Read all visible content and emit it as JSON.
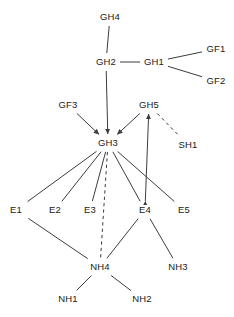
{
  "diagram": {
    "title": "",
    "width": 234,
    "height": 317,
    "background_color": "#ffffff",
    "edge_color": "#3c3c3c",
    "label_color": "#1a1a1a",
    "nodes": [
      {
        "id": "GH4",
        "label": "GH4",
        "x": 110,
        "y": 17
      },
      {
        "id": "GH2",
        "label": "GH2",
        "x": 106,
        "y": 62
      },
      {
        "id": "GH1",
        "label": "GH1",
        "x": 154,
        "y": 62
      },
      {
        "id": "GF1",
        "label": "GF1",
        "x": 216,
        "y": 49
      },
      {
        "id": "GF2",
        "label": "GF2",
        "x": 216,
        "y": 81
      },
      {
        "id": "GF3",
        "label": "GF3",
        "x": 68,
        "y": 105
      },
      {
        "id": "GH5",
        "label": "GH5",
        "x": 149,
        "y": 105
      },
      {
        "id": "SH1",
        "label": "SH1",
        "x": 188,
        "y": 145
      },
      {
        "id": "GH3",
        "label": "GH3",
        "x": 108,
        "y": 143
      },
      {
        "id": "E1",
        "label": "E1",
        "x": 16,
        "y": 210
      },
      {
        "id": "E2",
        "label": "E2",
        "x": 55,
        "y": 210
      },
      {
        "id": "E3",
        "label": "E3",
        "x": 90,
        "y": 210
      },
      {
        "id": "E4",
        "label": "E4",
        "x": 145,
        "y": 210
      },
      {
        "id": "E5",
        "label": "E5",
        "x": 184,
        "y": 210
      },
      {
        "id": "NH4",
        "label": "NH4",
        "x": 100,
        "y": 267
      },
      {
        "id": "NH3",
        "label": "NH3",
        "x": 178,
        "y": 267
      },
      {
        "id": "NH1",
        "label": "NH1",
        "x": 68,
        "y": 299
      },
      {
        "id": "NH2",
        "label": "NH2",
        "x": 142,
        "y": 299
      }
    ],
    "edges": [
      {
        "from": "GH4",
        "to": "GH2",
        "style": "solid",
        "arrow": "none"
      },
      {
        "from": "GH2",
        "to": "GH1",
        "style": "solid",
        "arrow": "none"
      },
      {
        "from": "GH1",
        "to": "GF1",
        "style": "solid",
        "arrow": "none"
      },
      {
        "from": "GH1",
        "to": "GF2",
        "style": "solid",
        "arrow": "none"
      },
      {
        "from": "GH2",
        "to": "GH3",
        "style": "solid",
        "arrow": "target"
      },
      {
        "from": "GF3",
        "to": "GH3",
        "style": "solid",
        "arrow": "target"
      },
      {
        "from": "GH5",
        "to": "GH3",
        "style": "solid",
        "arrow": "target"
      },
      {
        "from": "GH5",
        "to": "SH1",
        "style": "dashed",
        "arrow": "none"
      },
      {
        "from": "E4",
        "to": "GH5",
        "style": "solid",
        "arrow": "both"
      },
      {
        "from": "GH3",
        "to": "E1",
        "style": "solid",
        "arrow": "none"
      },
      {
        "from": "GH3",
        "to": "E2",
        "style": "solid",
        "arrow": "none"
      },
      {
        "from": "GH3",
        "to": "E3",
        "style": "solid",
        "arrow": "none"
      },
      {
        "from": "GH3",
        "to": "E4",
        "style": "solid",
        "arrow": "none"
      },
      {
        "from": "GH3",
        "to": "E5",
        "style": "solid",
        "arrow": "none"
      },
      {
        "from": "GH3",
        "to": "NH4",
        "style": "dashed",
        "arrow": "none"
      },
      {
        "from": "E1",
        "to": "NH4",
        "style": "solid",
        "arrow": "none"
      },
      {
        "from": "E4",
        "to": "NH4",
        "style": "solid",
        "arrow": "none"
      },
      {
        "from": "E4",
        "to": "NH3",
        "style": "solid",
        "arrow": "none"
      },
      {
        "from": "NH4",
        "to": "NH1",
        "style": "solid",
        "arrow": "none"
      },
      {
        "from": "NH4",
        "to": "NH2",
        "style": "solid",
        "arrow": "none"
      }
    ]
  }
}
